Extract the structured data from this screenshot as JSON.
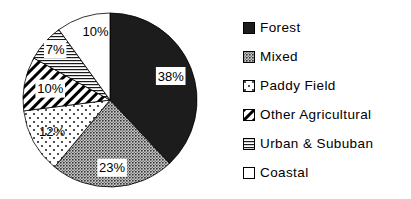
{
  "chart_data": {
    "type": "pie",
    "unit": "%",
    "start_angle_deg": 0,
    "direction": "clockwise",
    "legend_position": "right",
    "background": "#ffffff",
    "outline_color": "#000000",
    "colors": {
      "dark_slice": "#1c1c1c",
      "text": "#000000",
      "label_box": "#ffffff",
      "gray_mean": "#9a9a9a"
    },
    "categories": [
      "Forest",
      "Mixed",
      "Paddy Field",
      "Other Agricultural",
      "Urban & Sububan",
      "Coastal"
    ],
    "values": [
      38,
      23,
      12,
      10,
      7,
      10
    ],
    "slices": [
      {
        "category": "Forest",
        "value": 38,
        "label": "38%",
        "pattern": "solid-black",
        "legend_pattern": "solid-black",
        "label_in_box": true,
        "label_r": 0.75,
        "label_da": 0
      },
      {
        "category": "Mixed",
        "value": 23,
        "label": "23%",
        "pattern": "halftone-gray",
        "legend_pattern": "halftone-gray",
        "label_in_box": true,
        "label_r": 0.78,
        "label_da": 0
      },
      {
        "category": "Paddy Field",
        "value": 12,
        "label": "12%",
        "pattern": "sparse-dots",
        "legend_pattern": "sparse-dots",
        "label_in_box": false,
        "label_r": 0.76,
        "label_da": 0
      },
      {
        "category": "Other Agricultural",
        "value": 10,
        "label": "10%",
        "pattern": "diagonal-stripes",
        "legend_pattern": "diagonal-stripes",
        "label_in_box": true,
        "label_r": 0.7,
        "label_da": 0
      },
      {
        "category": "Urban & Sububan",
        "value": 7,
        "label": "7%",
        "pattern": "horizontal-lines",
        "legend_pattern": "horizontal-lines",
        "label_in_box": true,
        "label_r": 0.86,
        "label_da": 1.5
      },
      {
        "category": "Coastal",
        "value": 10,
        "label": "10%",
        "pattern": "white",
        "legend_pattern": "white",
        "label_in_box": false,
        "label_r": 0.8,
        "label_da": 6
      }
    ]
  }
}
